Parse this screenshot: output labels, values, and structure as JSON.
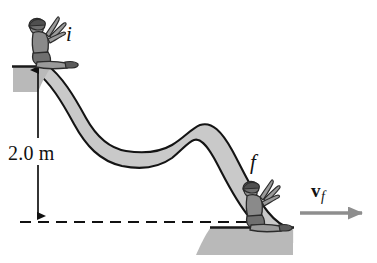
{
  "figure": {
    "labels": {
      "initial_point": "i",
      "final_point": "f",
      "height": "2.0 m",
      "velocity_symbol": "v",
      "velocity_subscript": "f"
    },
    "colors": {
      "slide_fill": "#c9c9c9",
      "slide_outline": "#141414",
      "platform_fill": "#b9b9b9",
      "platform_edge": "#1a1a1a",
      "figure_body": "#8a8a8a",
      "figure_outline": "#2b2b2b",
      "dimension_line": "#111111",
      "dashed_line": "#111111",
      "velocity_arrow": "#8e8e8e",
      "background": "#ffffff"
    },
    "geometry": {
      "height_value": 2.0,
      "height_unit": "m",
      "top_platform_top_y": 66,
      "bottom_platform_top_y": 227,
      "datum_line_y": 222,
      "dimension_arrow_x": 38
    },
    "elements": {
      "top_platform": "top-platform",
      "bottom_platform": "bottom-platform",
      "slide_curve": "slide-curve",
      "child_top": "child-figure-initial",
      "child_bottom": "child-figure-final",
      "height_dimension": "height-dimension-arrow",
      "datum": "datum-dashed-line",
      "velocity_vector": "velocity-arrow"
    }
  }
}
